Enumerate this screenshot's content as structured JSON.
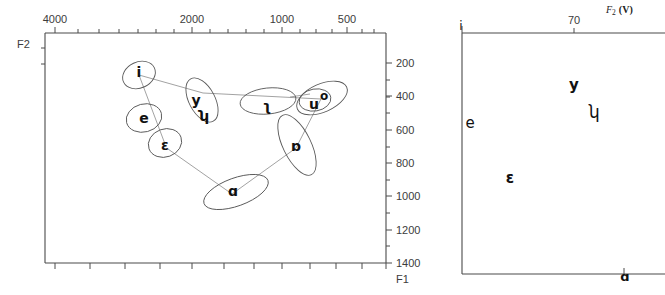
{
  "figure": {
    "background_color": "#ffffff",
    "line_color": "#4a4a4a",
    "ellipse_color": "#5a5a5a",
    "connector_color": "#8a8a8a",
    "text_color": "#111111"
  },
  "left_panel": {
    "name": "F1-F2 vowel space scatter with ellipses",
    "axes": {
      "x_axis_name": "F2",
      "x_axis_name_position": "top-left",
      "x_ticks_major": [
        "4000",
        "2000",
        "1000",
        "500"
      ],
      "x_tick_positions_px": [
        55,
        192,
        282,
        347
      ],
      "x_minor_tick_count": 16,
      "x_axis_position": "top",
      "x_direction": "decreasing",
      "y_axis_name": "F1",
      "y_axis_name_position": "bottom-right",
      "y_ticks_major": [
        "200",
        "400",
        "600",
        "800",
        "1000",
        "1200",
        "1400"
      ],
      "y_tick_values": [
        200,
        400,
        600,
        800,
        1000,
        1200,
        1400
      ],
      "y_axis_position": "right",
      "y_direction": "increasing-downward"
    },
    "vowels": [
      {
        "symbol": "i",
        "name": "vowel-i",
        "x": 139,
        "y": 72,
        "ellipse": {
          "cx": 139,
          "cy": 75,
          "rx": 17,
          "ry": 13,
          "rot": -25
        }
      },
      {
        "symbol": "e",
        "name": "vowel-e",
        "x": 144,
        "y": 118,
        "ellipse": {
          "cx": 144,
          "cy": 118,
          "rx": 18,
          "ry": 14,
          "rot": -15
        }
      },
      {
        "symbol": "ɛ",
        "name": "vowel-open-e",
        "x": 165,
        "y": 145,
        "ellipse": {
          "cx": 165,
          "cy": 143,
          "rx": 17,
          "ry": 14,
          "rot": -20
        }
      },
      {
        "symbol": "y",
        "name": "vowel-y",
        "x": 196,
        "y": 101,
        "ellipse": {
          "cx": 202,
          "cy": 100,
          "rx": 24,
          "ry": 13,
          "rot": 62
        }
      },
      {
        "symbol": "ʮ",
        "name": "vowel-hooked-u",
        "x": 203,
        "y": 117,
        "ellipse": null
      },
      {
        "symbol": "ʅ",
        "name": "vowel-backhook",
        "x": 267,
        "y": 106,
        "ellipse": {
          "cx": 268,
          "cy": 101,
          "rx": 28,
          "ry": 13,
          "rot": -6
        }
      },
      {
        "symbol": "u",
        "name": "vowel-u",
        "x": 315,
        "y": 104,
        "ellipse": {
          "cx": 315,
          "cy": 100,
          "rx": 16,
          "ry": 11,
          "rot": -10
        }
      },
      {
        "symbol": "o",
        "name": "vowel-o",
        "x": 323,
        "y": 97,
        "ellipse": {
          "cx": 322,
          "cy": 98,
          "rx": 27,
          "ry": 14,
          "rot": -24
        }
      },
      {
        "symbol": "ɒ",
        "name": "vowel-turned-script-a",
        "x": 296,
        "y": 146,
        "ellipse": {
          "cx": 297,
          "cy": 145,
          "rx": 33,
          "ry": 14,
          "rot": 64
        }
      },
      {
        "symbol": "ɑ",
        "name": "vowel-script-a",
        "x": 233,
        "y": 191,
        "ellipse": {
          "cx": 236,
          "cy": 192,
          "rx": 34,
          "ry": 14,
          "rot": -20
        }
      }
    ],
    "connector_polyline_note": "thin lines linking i -> y/ʮ -> u/o -> ɒ -> ɑ -> ɛ -> e -> i forming the vowel quadrilateral"
  },
  "right_panel": {
    "name": "F2 (V) normalized vowel space",
    "axes": {
      "x_axis_name": "F2 (V)",
      "x_axis_subscript": "2",
      "x_axis_paren": "(V)",
      "x_ticks_major": [
        "70"
      ],
      "x_tick_positions_px": [
        134
      ],
      "x_axis_position": "top",
      "y_axis_position": "left"
    },
    "vowels": [
      {
        "symbol": "i",
        "name": "vowel-i",
        "x": 2,
        "y": 8,
        "corner": "top-left"
      },
      {
        "symbol": "y",
        "name": "vowel-y",
        "x": 134,
        "y": 85,
        "corner": null
      },
      {
        "symbol": "ʮ",
        "name": "vowel-hooked-u",
        "x": 152,
        "y": 112,
        "corner": null
      },
      {
        "symbol": "e",
        "name": "vowel-e",
        "x": 10,
        "y": 123,
        "corner": null
      },
      {
        "symbol": "ɛ",
        "name": "vowel-open-e",
        "x": 70,
        "y": 178,
        "corner": null
      },
      {
        "symbol": "ɑ",
        "name": "vowel-script-a",
        "x": 184,
        "y": 270,
        "corner": "bottom-right"
      }
    ]
  }
}
